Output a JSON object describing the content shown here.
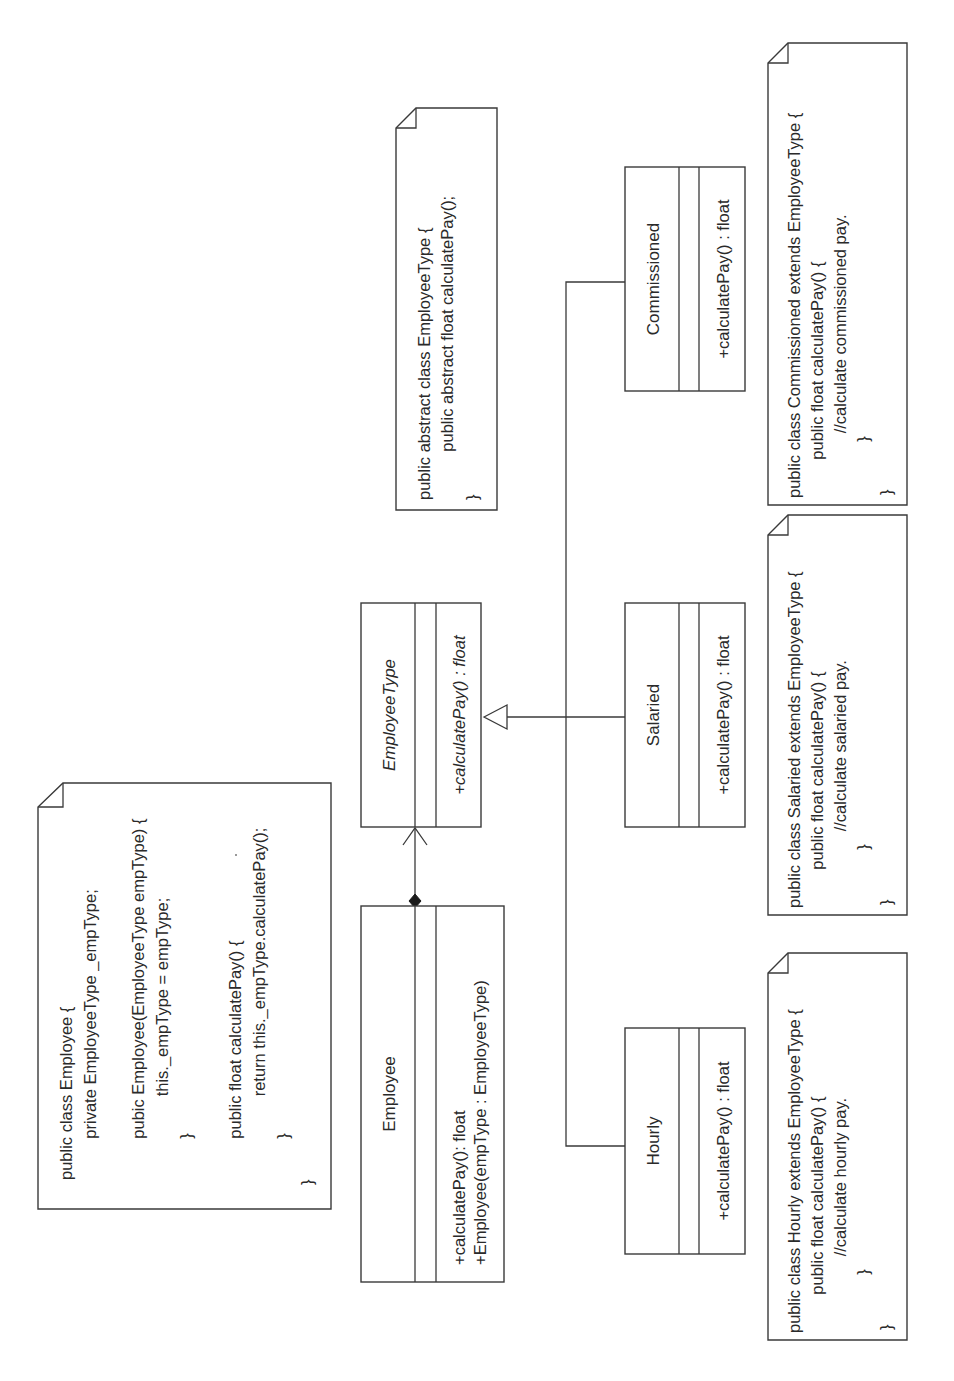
{
  "diagram": {
    "type": "UML class diagram (Strategy pattern)",
    "orientation": "rotated 90 degrees counter-clockwise",
    "classes": {
      "employee": {
        "name": "Employee",
        "abstract": false,
        "operations": [
          "+calculatePay(): float",
          "+Employee(empType : EmployeeType)"
        ]
      },
      "employee_type": {
        "name": "EmployeeType",
        "abstract": true,
        "operations": [
          "+calculatePay() : float"
        ]
      },
      "commissioned": {
        "name": "Commissioned",
        "abstract": false,
        "operations": [
          "+calculatePay() : float"
        ]
      },
      "salaried": {
        "name": "Salaried",
        "abstract": false,
        "operations": [
          "+calculatePay() : float"
        ]
      },
      "hourly": {
        "name": "Hourly",
        "abstract": false,
        "operations": [
          "+calculatePay() : float"
        ]
      }
    },
    "relationships": [
      {
        "type": "composition",
        "from": "Employee",
        "to": "EmployeeType",
        "navigable": true
      },
      {
        "type": "generalization",
        "from": "Commissioned",
        "to": "EmployeeType"
      },
      {
        "type": "generalization",
        "from": "Salaried",
        "to": "EmployeeType"
      },
      {
        "type": "generalization",
        "from": "Hourly",
        "to": "EmployeeType"
      }
    ],
    "notes": {
      "employee": [
        "public class Employee {",
        "    private EmployeeType _empType;",
        "",
        "    pubic Employee(EmployeeType empType) {",
        "        this._empType = empType;",
        "    }",
        "",
        "    public float calculatePay() {",
        "        return this._empType.calculatePay();",
        "    }",
        "}"
      ],
      "employee_type": [
        "public abstract class EmployeeType {",
        "    public abstract float calculatePay();",
        "",
        "}"
      ],
      "commissioned": [
        "public class Commissioned extends EmployeeType {",
        "    public float calculatePay() {",
        "        //calculate commissioned pay.",
        "    }",
        "}"
      ],
      "salaried": [
        "public class Salaried extends EmployeeType {",
        "    public float calculatePay() {",
        "        //calculate salaried pay.",
        "    }",
        "}"
      ],
      "hourly": [
        "public class Hourly extends EmployeeType {",
        "    public float calculatePay() {",
        "        //calculate hourly pay.",
        "    }",
        "}"
      ]
    }
  }
}
